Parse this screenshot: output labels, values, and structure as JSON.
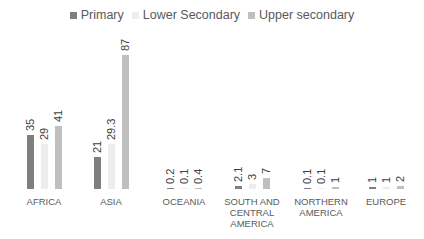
{
  "legend": [
    {
      "label": "Primary",
      "color": "#7f7f7f"
    },
    {
      "label": "Lower Secondary",
      "color": "#ededed"
    },
    {
      "label": "Upper secondary",
      "color": "#bfbfbf"
    }
  ],
  "chart_data": {
    "type": "bar",
    "title": "",
    "xlabel": "",
    "ylabel": "",
    "grid": false,
    "legend_position": "top",
    "categories": [
      "AFRICA",
      "ASIA",
      "OCEANIA",
      "SOUTH AND CENTRAL AMERICA",
      "NORTHERN AMERICA",
      "EUROPE"
    ],
    "series": [
      {
        "name": "Primary",
        "values": [
          35,
          21,
          0.2,
          2.1,
          0.1,
          1
        ],
        "labels": [
          "35",
          "21",
          "0.2",
          "2.1",
          "0.1",
          "1"
        ]
      },
      {
        "name": "Lower Secondary",
        "values": [
          29,
          29.3,
          0.1,
          3,
          0.1,
          1
        ],
        "labels": [
          "29",
          "29.3",
          "0.1",
          "3",
          "0.1",
          "1"
        ]
      },
      {
        "name": "Upper secondary",
        "values": [
          41,
          87,
          0.4,
          7,
          1,
          2
        ],
        "labels": [
          "41",
          "87",
          "0.4",
          "7",
          "1",
          "2"
        ]
      }
    ]
  },
  "category_labels": [
    [
      "AFRICA"
    ],
    [
      "ASIA"
    ],
    [
      "OCEANIA"
    ],
    [
      "SOUTH AND",
      "CENTRAL",
      "AMERICA"
    ],
    [
      "NORTHERN",
      "AMERICA"
    ],
    [
      "EUROPE"
    ]
  ]
}
